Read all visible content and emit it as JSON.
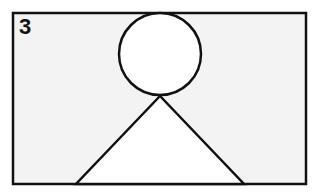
{
  "figure": {
    "panel_label": "3",
    "colors": {
      "panel_fill": "#f3f3f3",
      "stroke": "#111111",
      "shape_fill": "#ffffff"
    },
    "shapes": [
      {
        "type": "rectangle",
        "name": "panel-frame"
      },
      {
        "type": "circle",
        "name": "head-circle"
      },
      {
        "type": "triangle",
        "name": "body-triangle"
      }
    ]
  }
}
